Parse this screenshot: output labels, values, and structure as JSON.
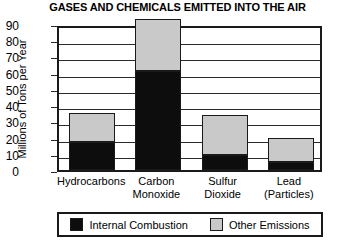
{
  "chart_data": {
    "type": "bar",
    "subtype": "stacked-vertical-bar",
    "title": "GASES AND CHEMICALS EMITTED INTO THE AIR",
    "xlabel": "",
    "ylabel": "Millions of Tons per Year",
    "ylim": [
      0,
      90
    ],
    "ytick_step": 10,
    "ytick_labels": [
      "90",
      "80",
      "70",
      "60",
      "50",
      "40",
      "30",
      "20",
      "10",
      "0"
    ],
    "ytick_values": [
      90,
      80,
      70,
      60,
      50,
      40,
      30,
      20,
      10,
      0
    ],
    "grid": "horizontal",
    "legend_position": "bottom",
    "categories": [
      "Hydrocarbons",
      "Carbon Monoxide",
      "Sulfur Dioxide",
      "Lead (Particles)"
    ],
    "category_lines": [
      [
        "Hydrocarbons"
      ],
      [
        "Carbon",
        "Monoxide"
      ],
      [
        "Sulfur",
        "Dioxide"
      ],
      [
        "Lead",
        "(Particles)"
      ]
    ],
    "series": [
      {
        "name": "Internal Combustion",
        "color": "#0d0d0d",
        "values": [
          17,
          61,
          9,
          5
        ]
      },
      {
        "name": "Other Emissions",
        "color": "#c9c9c9",
        "values": [
          18,
          32,
          25,
          15
        ]
      }
    ],
    "totals": [
      35,
      93,
      34,
      20
    ]
  },
  "legend": {
    "entries": [
      {
        "label": "Internal Combustion",
        "swatch": "dark"
      },
      {
        "label": "Other Emissions",
        "swatch": "light"
      }
    ]
  },
  "colors": {
    "internal_combustion": "#0d0d0d",
    "other_emissions": "#c9c9c9",
    "frame": "#1a1a1a",
    "background": "#ffffff"
  }
}
